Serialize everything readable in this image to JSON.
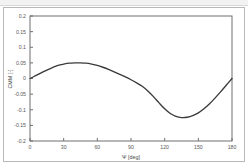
{
  "figure": {
    "name": "aerodynamic-coefficient-plot",
    "background": "#ffffff",
    "frame_color": "#b9b9b9",
    "axis_color": "#6f6f6f",
    "curve_color": "#3a3a3a"
  },
  "chart_data": {
    "type": "line",
    "title": "",
    "subtitle": "",
    "xlabel": "Ψ [deg]",
    "ylabel": "CMM [-]",
    "xlim": [
      0,
      180
    ],
    "ylim": [
      -0.2,
      0.2
    ],
    "xticks": [
      0,
      30,
      60,
      90,
      120,
      150,
      180
    ],
    "xtick_labels": [
      "0",
      "30",
      "60",
      "90",
      "120",
      "150",
      "180"
    ],
    "yticks": [
      0.2,
      0.15,
      0.1,
      0.05,
      0,
      -0.05,
      -0.1,
      -0.15,
      -0.2
    ],
    "ytick_labels": [
      "0.2",
      "0.15",
      "0.1",
      "0.05",
      "0",
      "-0.05",
      "-0.1",
      "-0.15",
      "-0.2"
    ],
    "grid": false,
    "legend": null,
    "legend_position": "none",
    "annotations": [],
    "series": [
      {
        "name": "CMM",
        "color": "#3a3a3a",
        "x": [
          0,
          5,
          10,
          15,
          20,
          25,
          30,
          35,
          40,
          45,
          50,
          55,
          60,
          65,
          70,
          75,
          80,
          85,
          90,
          95,
          100,
          105,
          110,
          115,
          120,
          125,
          130,
          135,
          140,
          145,
          150,
          155,
          160,
          165,
          170,
          175,
          180
        ],
        "values": [
          0.0,
          0.009,
          0.018,
          0.027,
          0.035,
          0.042,
          0.046,
          0.049,
          0.05,
          0.05,
          0.049,
          0.046,
          0.042,
          0.036,
          0.029,
          0.021,
          0.013,
          0.005,
          -0.004,
          -0.014,
          -0.025,
          -0.04,
          -0.058,
          -0.078,
          -0.097,
          -0.112,
          -0.121,
          -0.125,
          -0.124,
          -0.119,
          -0.11,
          -0.097,
          -0.081,
          -0.062,
          -0.042,
          -0.021,
          0.0
        ]
      }
    ]
  }
}
